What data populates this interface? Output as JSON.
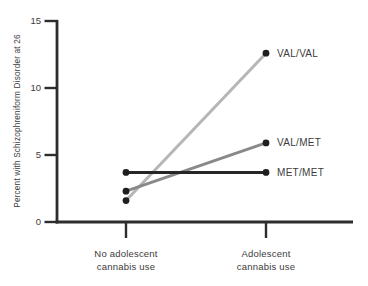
{
  "figure": {
    "background": "#ffffff"
  },
  "chart_data": {
    "type": "line",
    "title": "",
    "ylabel": "Percent with Schizophreniform Disorder at 26",
    "xlabel": "",
    "categories": [
      [
        "No adolescent",
        "cannabis use"
      ],
      [
        "Adolescent",
        "cannabis use"
      ]
    ],
    "ylim": [
      0,
      15
    ],
    "yticks": [
      0,
      5,
      10,
      15
    ],
    "grid": false,
    "legend_position": "end-of-line-labels",
    "series": [
      {
        "name": "VAL/VAL",
        "values": [
          1.6,
          12.6
        ],
        "color": "#b6b6b6"
      },
      {
        "name": "VAL/MET",
        "values": [
          2.3,
          5.9
        ],
        "color": "#898989"
      },
      {
        "name": "MET/MET",
        "values": [
          3.7,
          3.7
        ],
        "color": "#262626"
      }
    ],
    "marker_color": "#1e1e1e",
    "axis_color": "#2d2d2d",
    "label_color": "#3c3c3c"
  }
}
